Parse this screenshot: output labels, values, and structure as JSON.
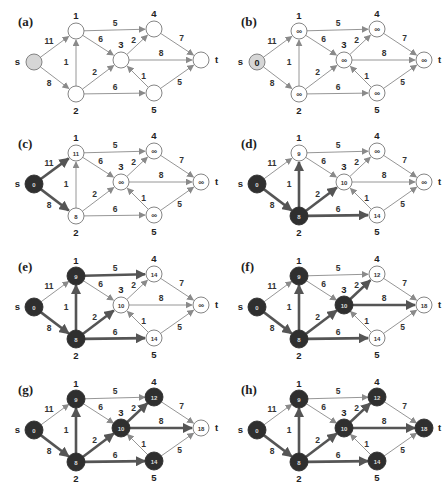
{
  "figure": {
    "colors": {
      "edge_normal": "#8a8a8a",
      "edge_highlight": "#555555",
      "node_visited": "#2f2f2f",
      "node_source_initial": "#d6d6d6",
      "node_open": "#ffffff",
      "node_stroke": "#777777",
      "text": "#222222"
    },
    "nodes": [
      {
        "id": "s",
        "label": "s",
        "x": 34,
        "y": 62,
        "label_pos": "left"
      },
      {
        "id": "1",
        "label": "1",
        "x": 76,
        "y": 31,
        "label_pos": "top"
      },
      {
        "id": "2",
        "label": "2",
        "x": 76,
        "y": 94,
        "label_pos": "bottom"
      },
      {
        "id": "3",
        "label": "3",
        "x": 121,
        "y": 60,
        "label_pos": "top"
      },
      {
        "id": "4",
        "label": "4",
        "x": 154,
        "y": 29,
        "label_pos": "top"
      },
      {
        "id": "5",
        "label": "5",
        "x": 154,
        "y": 93,
        "label_pos": "bottom"
      },
      {
        "id": "t",
        "label": "t",
        "x": 201,
        "y": 60,
        "label_pos": "right"
      }
    ],
    "edges": [
      {
        "from": "s",
        "to": "1",
        "weight": "11"
      },
      {
        "from": "s",
        "to": "2",
        "weight": "8"
      },
      {
        "from": "1",
        "to": "4",
        "weight": "5"
      },
      {
        "from": "1",
        "to": "3",
        "weight": "6"
      },
      {
        "from": "2",
        "to": "1",
        "weight": "1"
      },
      {
        "from": "2",
        "to": "3",
        "weight": "2"
      },
      {
        "from": "2",
        "to": "5",
        "weight": "6"
      },
      {
        "from": "3",
        "to": "4",
        "weight": "2"
      },
      {
        "from": "3",
        "to": "t",
        "weight": "8"
      },
      {
        "from": "5",
        "to": "3",
        "weight": "1"
      },
      {
        "from": "4",
        "to": "t",
        "weight": "7"
      },
      {
        "from": "5",
        "to": "t",
        "weight": "5"
      }
    ],
    "panels": [
      {
        "label": "(a)",
        "x": 0,
        "y": 0,
        "dist": {
          "s": "",
          "1": "",
          "2": "",
          "3": "",
          "4": "",
          "5": "",
          "t": ""
        },
        "visited": [],
        "source_shaded": true,
        "highlight_edges": []
      },
      {
        "label": "(b)",
        "x": 223,
        "y": 0,
        "dist": {
          "s": "0",
          "1": "∞",
          "2": "∞",
          "3": "∞",
          "4": "∞",
          "5": "∞",
          "t": "∞"
        },
        "visited": [],
        "source_shaded": true,
        "highlight_edges": []
      },
      {
        "label": "(c)",
        "x": 0,
        "y": 122,
        "dist": {
          "s": "0",
          "1": "11",
          "2": "8",
          "3": "∞",
          "4": "∞",
          "5": "∞",
          "t": "∞"
        },
        "visited": [
          "s"
        ],
        "source_shaded": false,
        "highlight_edges": [
          "s-1",
          "s-2"
        ]
      },
      {
        "label": "(d)",
        "x": 223,
        "y": 122,
        "dist": {
          "s": "0",
          "1": "9",
          "2": "8",
          "3": "10",
          "4": "∞",
          "5": "14",
          "t": "∞"
        },
        "visited": [
          "s",
          "2"
        ],
        "source_shaded": false,
        "highlight_edges": [
          "s-2",
          "2-1",
          "2-3",
          "2-5"
        ]
      },
      {
        "label": "(e)",
        "x": 0,
        "y": 245,
        "dist": {
          "s": "0",
          "1": "9",
          "2": "8",
          "3": "10",
          "4": "14",
          "5": "14",
          "t": "∞"
        },
        "visited": [
          "s",
          "2",
          "1"
        ],
        "source_shaded": false,
        "highlight_edges": [
          "s-2",
          "2-1",
          "2-3",
          "2-5",
          "1-4"
        ]
      },
      {
        "label": "(f)",
        "x": 223,
        "y": 245,
        "dist": {
          "s": "0",
          "1": "9",
          "2": "8",
          "3": "10",
          "4": "12",
          "5": "14",
          "t": "18"
        },
        "visited": [
          "s",
          "2",
          "1",
          "3"
        ],
        "source_shaded": false,
        "highlight_edges": [
          "s-2",
          "2-1",
          "2-3",
          "2-5",
          "3-4",
          "3-t"
        ]
      },
      {
        "label": "(g)",
        "x": 0,
        "y": 368,
        "dist": {
          "s": "0",
          "1": "9",
          "2": "8",
          "3": "10",
          "4": "12",
          "5": "14",
          "t": "18"
        },
        "visited": [
          "s",
          "2",
          "1",
          "3",
          "4",
          "5"
        ],
        "source_shaded": false,
        "highlight_edges": [
          "s-2",
          "2-1",
          "2-3",
          "2-5",
          "3-4",
          "3-t"
        ]
      },
      {
        "label": "(h)",
        "x": 223,
        "y": 368,
        "dist": {
          "s": "0",
          "1": "9",
          "2": "8",
          "3": "10",
          "4": "12",
          "5": "14",
          "t": "18"
        },
        "visited": [
          "s",
          "2",
          "1",
          "3",
          "4",
          "5",
          "t"
        ],
        "source_shaded": false,
        "highlight_edges": [
          "s-2",
          "2-1",
          "2-3",
          "2-5",
          "3-4",
          "3-t"
        ]
      }
    ]
  }
}
